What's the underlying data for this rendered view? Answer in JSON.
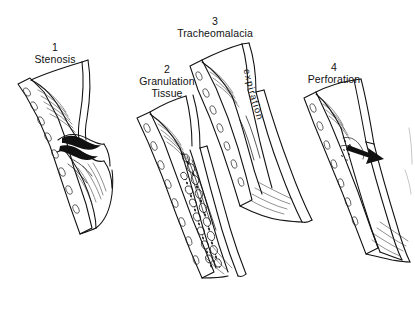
{
  "figure": {
    "background_color": "#ffffff",
    "ink_color": "#111111",
    "style": "pen-and-ink line drawing"
  },
  "panels": [
    {
      "number": "1",
      "label": "Stenosis",
      "label_line2": "",
      "description": "Longitudinal section of trachea showing a circumferential narrowing of the lumen with thickened scar at the stenotic segment; cartilage rings visible along the wall."
    },
    {
      "number": "2",
      "label": "Granulation",
      "label_line2": "Tissue",
      "description": "Longitudinal section of trachea with nodular granulation tissue filling and obstructing the lumen along the inner wall."
    },
    {
      "number": "3",
      "label": "Tracheomalacia",
      "label_line2": "",
      "description": "Longitudinal section of trachea showing softened collapsing wall narrowing during expiration.",
      "annotation": "expiration"
    },
    {
      "number": "4",
      "label": "Perforation",
      "label_line2": "",
      "description": "Longitudinal section of trachea with a full-thickness defect in the wall; a solid arrow indicates the direction of passage through the perforation."
    }
  ],
  "annotations": {
    "expiration": "expiration"
  }
}
